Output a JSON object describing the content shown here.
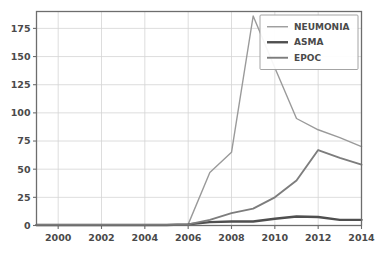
{
  "chart_data": {
    "type": "line",
    "title": "",
    "xlabel": "",
    "ylabel": "",
    "xlim": [
      1999,
      2014
    ],
    "ylim": [
      0,
      190
    ],
    "grid": true,
    "legend_position": "top-right",
    "x": [
      1999,
      2000,
      2001,
      2002,
      2003,
      2004,
      2005,
      2006,
      2007,
      2008,
      2009,
      2010,
      2011,
      2012,
      2013,
      2014
    ],
    "xticks": [
      2000,
      2002,
      2004,
      2006,
      2008,
      2010,
      2012,
      2014
    ],
    "xtick_labels": [
      "2000",
      "2002",
      "2004",
      "2006",
      "2008",
      "2010",
      "2012",
      "2014"
    ],
    "yticks": [
      0,
      25,
      50,
      75,
      100,
      125,
      150,
      175
    ],
    "ytick_labels": [
      "0",
      "25",
      "50",
      "75",
      "100",
      "125",
      "150",
      "175"
    ],
    "series": [
      {
        "name": "NEUMONIA",
        "color": "#9a9a9a",
        "width": 1.4,
        "values": [
          0.5,
          0.5,
          0.5,
          0.5,
          0.5,
          0.5,
          0.5,
          1,
          47,
          65,
          186,
          140,
          95,
          85,
          78,
          70
        ]
      },
      {
        "name": "ASMA",
        "color": "#4f4f4f",
        "width": 2.4,
        "values": [
          0.5,
          0.5,
          0.5,
          0.5,
          0.5,
          0.5,
          0.5,
          1,
          3,
          3.5,
          3.5,
          6,
          8,
          7.5,
          5,
          5
        ]
      },
      {
        "name": "EPOC",
        "color": "#7d7d7d",
        "width": 1.9,
        "values": [
          0.5,
          0.5,
          0.5,
          0.5,
          0.5,
          0.5,
          0.5,
          1,
          5,
          11,
          15,
          25,
          40,
          67,
          60,
          54
        ]
      }
    ]
  },
  "legend": {
    "entries": [
      {
        "label": "NEUMONIA"
      },
      {
        "label": "ASMA"
      },
      {
        "label": "EPOC"
      }
    ]
  },
  "colors": {
    "background": "#ffffff",
    "gridline": "#d4d4d4",
    "frame": "#6d6d6d",
    "text": "#4a4a4a"
  }
}
